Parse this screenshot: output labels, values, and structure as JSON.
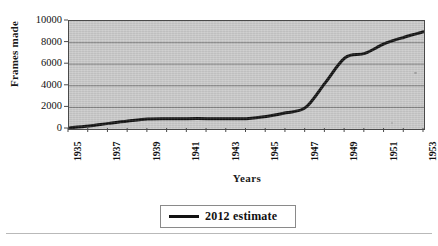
{
  "chart_data": {
    "type": "line",
    "title": "",
    "xlabel": "Years",
    "ylabel": "Frames made",
    "xlim": [
      1935,
      1953
    ],
    "ylim": [
      0,
      10000
    ],
    "grid": true,
    "legend_position": "bottom",
    "y_ticks": [
      10000,
      8000,
      6000,
      4000,
      2000,
      0
    ],
    "y_tick_labels": [
      "10000",
      "8000",
      "6000",
      "4000",
      "2000",
      "0"
    ],
    "x_ticks": [
      1935,
      1937,
      1939,
      1941,
      1943,
      1945,
      1947,
      1949,
      1951,
      1953
    ],
    "x_tick_labels": [
      "1935",
      "1937",
      "1939",
      "1941",
      "1943",
      "1945",
      "1947",
      "1949",
      "1951",
      "1953"
    ],
    "x_minor_ticks": [
      1936,
      1938,
      1940,
      1942,
      1944,
      1946,
      1948,
      1950,
      1952
    ],
    "series": [
      {
        "name": "2012 estimate",
        "color": "#111111",
        "line_width": 3,
        "x": [
          1935,
          1936,
          1937,
          1938,
          1939,
          1940,
          1941,
          1942,
          1943,
          1944,
          1945,
          1946,
          1947,
          1948,
          1949,
          1950,
          1951,
          1952,
          1953
        ],
        "values": [
          100,
          280,
          520,
          740,
          920,
          950,
          960,
          960,
          960,
          960,
          1150,
          1500,
          2000,
          4300,
          6600,
          7000,
          7900,
          8500,
          9000
        ]
      }
    ]
  },
  "axes": {
    "y_title": "Frames made",
    "x_title": "Years"
  },
  "legend": {
    "entries": [
      {
        "label": "2012 estimate",
        "color": "#111111"
      }
    ]
  },
  "style": {
    "plot_background": "#c9c9c9",
    "gridline_color": "#7d7d7d",
    "axis_color": "#4a4a4a",
    "page_background": "#ffffff",
    "line_color": "#111111"
  }
}
